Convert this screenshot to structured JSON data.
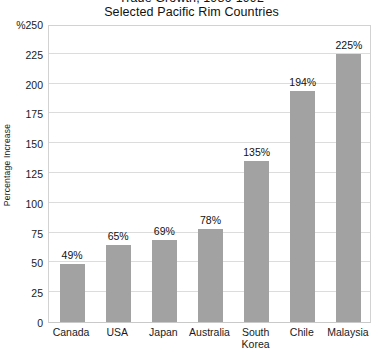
{
  "chart_data": {
    "type": "bar",
    "title": "Trade Growth, 1986-1992",
    "subtitle": "Selected Pacific Rim Countries",
    "xlabel": "",
    "ylabel": "Percentage Increase",
    "categories": [
      "Canada",
      "USA",
      "Japan",
      "Australia",
      "South Korea",
      "Chile",
      "Malaysia"
    ],
    "category_lines": [
      [
        "Canada"
      ],
      [
        "USA"
      ],
      [
        "Japan"
      ],
      [
        "Australia"
      ],
      [
        "South",
        "Korea"
      ],
      [
        "Chile"
      ],
      [
        "Malaysia"
      ]
    ],
    "values": [
      49,
      65,
      69,
      78,
      135,
      194,
      225
    ],
    "value_labels": [
      "49%",
      "65%",
      "69%",
      "78%",
      "135%",
      "194%",
      "225%"
    ],
    "ylim": [
      0,
      250
    ],
    "yticks": [
      0,
      25,
      50,
      75,
      100,
      125,
      150,
      175,
      200,
      225,
      250
    ],
    "ytick_labels": [
      "0",
      "25",
      "50",
      "75",
      "100",
      "125",
      "150",
      "175",
      "200",
      "225",
      "%250"
    ],
    "grid": true,
    "legend": false,
    "bar_color": "#a2a2a2",
    "grid_color": "#dcdcdc",
    "frame_color": "#d2d2d2"
  }
}
